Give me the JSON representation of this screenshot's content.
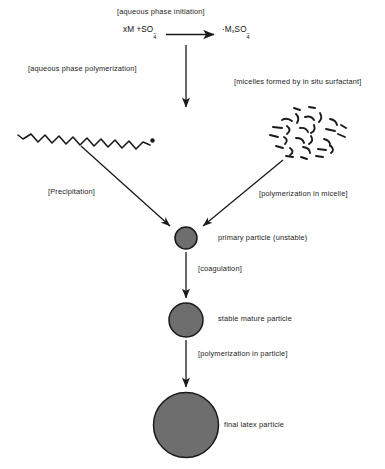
{
  "diagram": {
    "background_color": "#ffffff",
    "line_color": "#1a1a1a",
    "particle_fill": "#6e6e6e",
    "particle_stroke": "#1a1a1a"
  },
  "equation": {
    "reactant": "xM +SO",
    "reactant_sub": "4",
    "reactant_sup": "−",
    "product_radical": "·M",
    "product_sub_x": "x",
    "product_so": "SO",
    "product_sub4": "4",
    "product_sup": "−",
    "arrow": "→"
  },
  "labels": {
    "initiation": "[aqueous phase initiation]",
    "aqueous_polymerization": "[aqueous phase polymerization]",
    "micelles": "[micelles formed by in situ surfactant]",
    "precipitation": "[Precipitation]",
    "polymerization_in_micelle": "[polymerization in micelle]",
    "coagulation": "[coagulation]",
    "polymerization_in_particle": "[polymerization in particle]"
  },
  "species": {
    "primary_particle": "primary particle (unstable)",
    "stable_mature_particle": "stable mature particle",
    "final_latex_particle": "final latex particle"
  },
  "particles": [
    {
      "name": "primary-particle",
      "cx": 186,
      "cy": 238,
      "r": 11
    },
    {
      "name": "stable-mature-particle",
      "cx": 186,
      "cy": 320,
      "r": 17
    },
    {
      "name": "final-latex-particle",
      "cx": 186,
      "cy": 425,
      "r": 32.5
    }
  ]
}
